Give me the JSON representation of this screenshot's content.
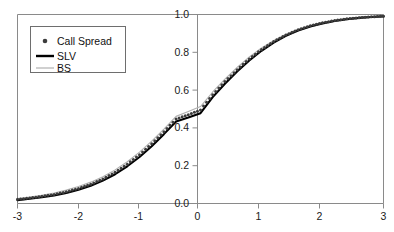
{
  "chart_data": {
    "type": "line",
    "title": "",
    "xlabel": "",
    "ylabel": "",
    "xlim": [
      -3,
      3
    ],
    "ylim": [
      0.0,
      1.0
    ],
    "grid": false,
    "legend_position": "upper left",
    "xticks": [
      "-3",
      "-2",
      "-1",
      "0",
      "1",
      "2",
      "3"
    ],
    "xtick_values": [
      -3,
      -2,
      -1,
      0,
      1,
      2,
      3
    ],
    "yticks": [
      "0.0",
      "0.2",
      "0.4",
      "0.6",
      "0.8",
      "1.0"
    ],
    "ytick_values": [
      0.0,
      0.2,
      0.4,
      0.6,
      0.8,
      1.0
    ],
    "x": [
      -3.0,
      -2.8,
      -2.6,
      -2.4,
      -2.2,
      -2.0,
      -1.8,
      -1.6,
      -1.4,
      -1.2,
      -1.0,
      -0.8,
      -0.6,
      -0.4,
      -0.2,
      0.0,
      0.2,
      0.4,
      0.6,
      0.8,
      1.0,
      1.2,
      1.4,
      1.6,
      1.8,
      2.0,
      2.2,
      2.4,
      2.6,
      2.8,
      3.0
    ],
    "series": [
      {
        "name": "Call Spread",
        "style": "markers",
        "marker": "dot",
        "color": "#3c3c3c",
        "values": [
          0.022,
          0.029,
          0.038,
          0.048,
          0.062,
          0.08,
          0.102,
          0.13,
          0.165,
          0.208,
          0.258,
          0.316,
          0.38,
          0.447,
          0.47,
          0.495,
          0.576,
          0.645,
          0.708,
          0.765,
          0.815,
          0.857,
          0.892,
          0.919,
          0.94,
          0.956,
          0.968,
          0.977,
          0.983,
          0.988,
          0.991
        ]
      },
      {
        "name": "SLV",
        "style": "line",
        "color": "#000000",
        "linewidth": 2.1,
        "values": [
          0.018,
          0.025,
          0.033,
          0.043,
          0.056,
          0.073,
          0.094,
          0.121,
          0.155,
          0.197,
          0.246,
          0.303,
          0.367,
          0.434,
          0.455,
          0.478,
          0.563,
          0.634,
          0.699,
          0.757,
          0.808,
          0.851,
          0.887,
          0.915,
          0.937,
          0.953,
          0.966,
          0.975,
          0.982,
          0.987,
          0.99
        ]
      },
      {
        "name": "BS",
        "style": "line",
        "color": "#b0b0b0",
        "linewidth": 1.1,
        "values": [
          0.026,
          0.034,
          0.044,
          0.056,
          0.071,
          0.09,
          0.113,
          0.142,
          0.178,
          0.221,
          0.272,
          0.33,
          0.394,
          0.461,
          0.487,
          0.513,
          0.59,
          0.658,
          0.72,
          0.775,
          0.823,
          0.863,
          0.896,
          0.922,
          0.943,
          0.958,
          0.97,
          0.978,
          0.984,
          0.989,
          0.992
        ]
      }
    ],
    "legend": [
      {
        "label": "Call Spread",
        "marker": "dot",
        "color": "#3c3c3c"
      },
      {
        "label": "SLV",
        "marker": "thick-line",
        "color": "#000000"
      },
      {
        "label": "BS",
        "marker": "thin-line",
        "color": "#b0b0b0"
      }
    ]
  }
}
